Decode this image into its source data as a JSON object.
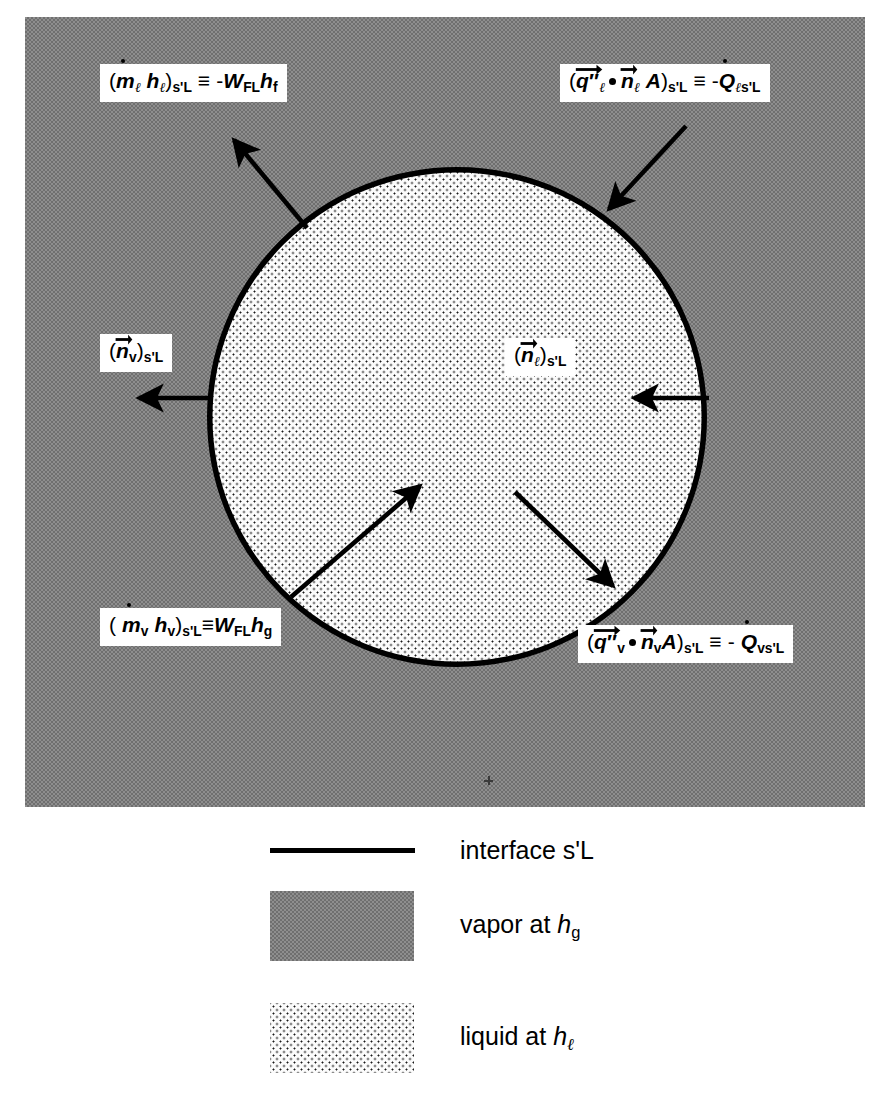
{
  "figure": {
    "background_color": "#8e8e8e",
    "liquid_color": "#fbfbfb",
    "outline_color": "#000000"
  },
  "callouts": {
    "liquid_enthalpy_flux": {
      "name": "liquid-enthalpy-flux-equation",
      "text_plain": "(ṁℓ hℓ)s'L ≡ -W_FL h_f"
    },
    "liquid_heat_flux": {
      "name": "liquid-heat-flux-equation",
      "text_plain": "(q⃗″ℓ · n⃗ℓ A)s'L ≡ -Q̇ℓs'L"
    },
    "vapor_normal": {
      "name": "vapor-normal-vector",
      "text_plain": "(n⃗v)s'L"
    },
    "liquid_normal": {
      "name": "liquid-normal-vector",
      "text_plain": "(n⃗ℓ)s'L"
    },
    "vapor_enthalpy_flux": {
      "name": "vapor-enthalpy-flux-equation",
      "text_plain": "( ṁv hv)s'L ≡ W_FL h_g"
    },
    "vapor_heat_flux": {
      "name": "vapor-heat-flux-equation",
      "text_plain": "(q⃗″v · n⃗v A)s'L ≡ - Q̇vs'L"
    }
  },
  "legend": {
    "items": [
      {
        "swatch": "line",
        "label": "interface s'L"
      },
      {
        "swatch": "gray-fill",
        "label": "vapor at h",
        "label_sub": "g",
        "label_prefix": "vapor at ",
        "label_var": "h"
      },
      {
        "swatch": "dotted-fill",
        "label": "liquid at h",
        "label_sub": "ℓ",
        "label_prefix": "liquid at ",
        "label_var": "h"
      }
    ],
    "interface_label": "interface s'L",
    "vapor_label_prefix": "vapor at ",
    "vapor_label_var": "h",
    "vapor_label_sub": "g",
    "liquid_label_prefix": "liquid at ",
    "liquid_label_var": "h",
    "liquid_label_sub": "ℓ"
  },
  "symbols": {
    "s_prime_L": "s'L",
    "W_FL": "W",
    "FL": "FL",
    "h_f": "f",
    "h_g": "g",
    "ell": "ℓ",
    "v": "v",
    "equiv": "≡",
    "minus": "-",
    "A": "A",
    "Q": "Q",
    "q": "q",
    "n": "n",
    "m": "m",
    "h": "h",
    "double_prime": "″"
  }
}
